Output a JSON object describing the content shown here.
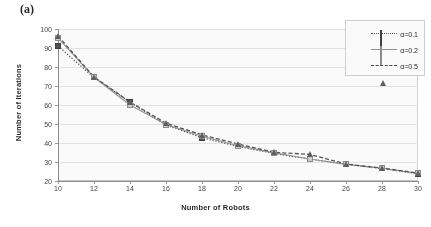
{
  "panel": {
    "label": "(a)"
  },
  "chart_data": {
    "type": "line",
    "title": "",
    "xlabel": "Number of Robots",
    "ylabel": "Number of Iterations",
    "x": [
      10,
      12,
      14,
      16,
      18,
      20,
      22,
      24,
      26,
      28,
      30
    ],
    "xlim": [
      10,
      30
    ],
    "ylim": [
      20,
      100
    ],
    "xticks": [
      10,
      12,
      14,
      16,
      18,
      20,
      22,
      24,
      26,
      28,
      30
    ],
    "yticks": [
      20,
      30,
      40,
      50,
      60,
      70,
      80,
      90,
      100
    ],
    "grid": "horizontal",
    "legend_position": "top-right",
    "series": [
      {
        "name": "α=0.1",
        "linestyle": "dotted",
        "marker": "filled-square",
        "color": "#4a4a4a",
        "values": [
          91.0,
          74.5,
          61.5,
          49.5,
          42.8,
          38.2,
          34.5,
          31.5,
          28.7,
          26.6,
          23.8
        ]
      },
      {
        "name": "α=0.2",
        "linestyle": "solid",
        "marker": "open-square",
        "color": "#8f8f8f",
        "values": [
          95.3,
          74.6,
          60.0,
          49.7,
          43.6,
          38.6,
          34.8,
          31.6,
          28.8,
          26.7,
          24.0
        ]
      },
      {
        "name": "α=0.5",
        "linestyle": "dashed",
        "marker": "triangle",
        "color": "#4f4f4f",
        "values": [
          96.3,
          74.8,
          61.6,
          50.4,
          44.3,
          39.5,
          35.1,
          34.0,
          28.9,
          26.8,
          24.2
        ]
      }
    ]
  },
  "legend": {
    "items": [
      {
        "label": "α=0.1"
      },
      {
        "label": "α=0.2"
      },
      {
        "label": "α=0.5"
      }
    ]
  },
  "axis": {
    "y_labels": [
      "100",
      "90",
      "80",
      "70",
      "60",
      "50",
      "40",
      "30",
      "20"
    ],
    "x_labels": [
      "10",
      "12",
      "14",
      "16",
      "18",
      "20",
      "22",
      "24",
      "26",
      "28",
      "30"
    ],
    "x_title": "Number of Robots",
    "y_title": "Number of Iterations"
  }
}
